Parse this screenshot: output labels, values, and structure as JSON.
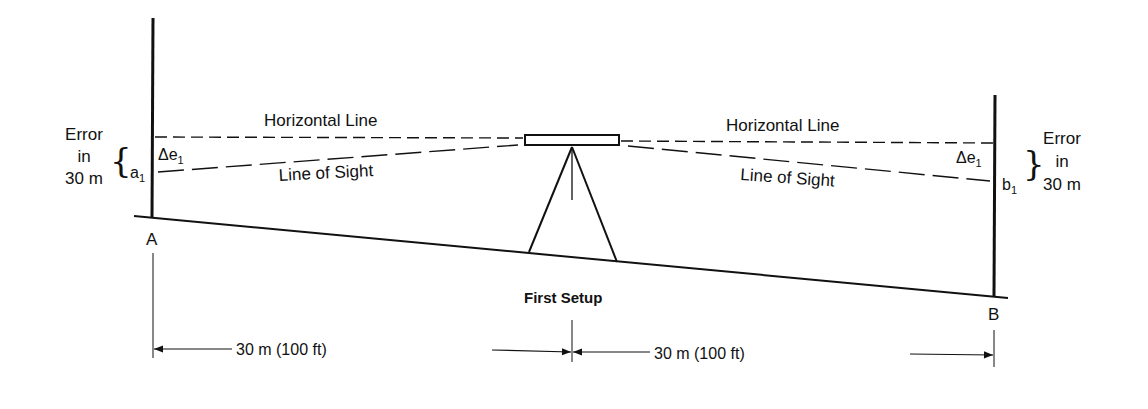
{
  "labels": {
    "horizontal_line_left": "Horizontal Line",
    "horizontal_line_right": "Horizontal Line",
    "line_of_sight_left": "Line of Sight",
    "line_of_sight_right": "Line of Sight",
    "error_left": [
      "Error",
      "in",
      "30 m"
    ],
    "error_right": [
      "Error",
      "in",
      "30 m"
    ],
    "delta_e_left": {
      "main": "Δe",
      "sub": "1"
    },
    "delta_e_right": {
      "main": "Δe",
      "sub": "1"
    },
    "reading_a": {
      "main": "a",
      "sub": "1"
    },
    "reading_b": {
      "main": "b",
      "sub": "1"
    },
    "point_a": "A",
    "point_b": "B",
    "setup": "First Setup",
    "distance_left": "30 m (100 ft)",
    "distance_right": "30 m (100 ft)"
  },
  "colors": {
    "line": "#111111",
    "background": "#ffffff"
  }
}
